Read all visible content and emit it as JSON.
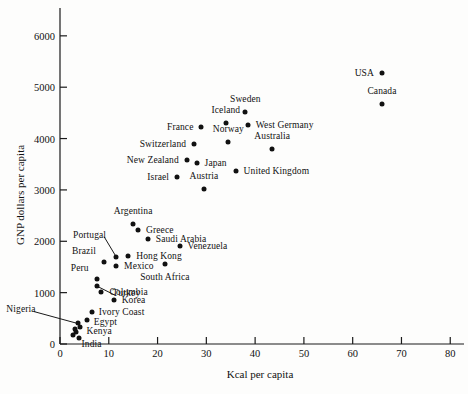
{
  "chart_data": {
    "type": "scatter",
    "title": "",
    "xlabel": "Kcal per capita",
    "ylabel": "GNP dollars per capita",
    "xlim": [
      0,
      82
    ],
    "ylim": [
      0,
      6250
    ],
    "xticks": [
      0,
      10,
      20,
      30,
      40,
      50,
      60,
      70,
      80
    ],
    "yticks": [
      0,
      1000,
      2000,
      3000,
      4000,
      5000,
      6000
    ],
    "grid": false,
    "legend": null,
    "marker_color": "#111111",
    "axis_color": "#1a1a1a",
    "background": "#fdfdfc",
    "points": [
      {
        "label": "USA",
        "x": 66.0,
        "y": 5270,
        "lx": -8,
        "ly": 0,
        "anchor": "r"
      },
      {
        "label": "Canada",
        "x": 66.0,
        "y": 4670,
        "lx": 0,
        "ly": -13,
        "anchor": "c"
      },
      {
        "label": "Sweden",
        "x": 38.0,
        "y": 4520,
        "lx": 0,
        "ly": -13,
        "anchor": "c"
      },
      {
        "label": "Iceland",
        "x": 34.0,
        "y": 4300,
        "lx": 0,
        "ly": -13,
        "anchor": "c"
      },
      {
        "label": "West Germany",
        "x": 38.5,
        "y": 4270,
        "lx": 8,
        "ly": 0,
        "anchor": "l"
      },
      {
        "label": "France",
        "x": 29.0,
        "y": 4230,
        "lx": -8,
        "ly": 0,
        "anchor": "r"
      },
      {
        "label": "Norway",
        "x": 34.5,
        "y": 3940,
        "lx": 0,
        "ly": -13,
        "anchor": "c"
      },
      {
        "label": "Switzerland",
        "x": 27.5,
        "y": 3900,
        "lx": -8,
        "ly": 0,
        "anchor": "r"
      },
      {
        "label": "Australia",
        "x": 43.5,
        "y": 3800,
        "lx": 0,
        "ly": -13,
        "anchor": "c"
      },
      {
        "label": "New Zealand",
        "x": 26.0,
        "y": 3590,
        "lx": -8,
        "ly": 0,
        "anchor": "r"
      },
      {
        "label": "Japan",
        "x": 28.0,
        "y": 3520,
        "lx": 8,
        "ly": 0,
        "anchor": "l"
      },
      {
        "label": "United Kingdom",
        "x": 36.0,
        "y": 3370,
        "lx": 8,
        "ly": 0,
        "anchor": "l"
      },
      {
        "label": "Israel",
        "x": 24.0,
        "y": 3250,
        "lx": -8,
        "ly": 0,
        "anchor": "r"
      },
      {
        "label": "Austria",
        "x": 29.5,
        "y": 3010,
        "lx": 0,
        "ly": -13,
        "anchor": "c"
      },
      {
        "label": "Argentina",
        "x": 15.0,
        "y": 2330,
        "lx": 0,
        "ly": -13,
        "anchor": "c"
      },
      {
        "label": "Greece",
        "x": 16.0,
        "y": 2220,
        "lx": 8,
        "ly": 0,
        "anchor": "l"
      },
      {
        "label": "Saudi Arabia",
        "x": 18.0,
        "y": 2040,
        "lx": 8,
        "ly": 0,
        "anchor": "l"
      },
      {
        "label": "Venezuela",
        "x": 24.5,
        "y": 1900,
        "lx": 8,
        "ly": 0,
        "anchor": "l"
      },
      {
        "label": "Hong Kong",
        "x": 14.0,
        "y": 1710,
        "lx": 8,
        "ly": 0,
        "anchor": "l"
      },
      {
        "label": "Portugal",
        "x": 11.5,
        "y": 1700,
        "lx": -10,
        "ly": -22,
        "anchor": "r",
        "leader": true
      },
      {
        "label": "Brazil",
        "x": 9.0,
        "y": 1600,
        "lx": -8,
        "ly": -11,
        "anchor": "r"
      },
      {
        "label": "South Africa",
        "x": 21.5,
        "y": 1560,
        "lx": 0,
        "ly": 13,
        "anchor": "c"
      },
      {
        "label": "Mexico",
        "x": 11.5,
        "y": 1510,
        "lx": 8,
        "ly": 0,
        "anchor": "l"
      },
      {
        "label": "Peru",
        "x": 7.5,
        "y": 1270,
        "lx": -8,
        "ly": -11,
        "anchor": "r"
      },
      {
        "label": "Turkey",
        "x": 7.5,
        "y": 1130,
        "lx": 16,
        "ly": 7,
        "anchor": "l",
        "leader": true
      },
      {
        "label": "Columbia",
        "x": 8.5,
        "y": 1010,
        "lx": 8,
        "ly": 0,
        "anchor": "l"
      },
      {
        "label": "Korea",
        "x": 11.0,
        "y": 860,
        "lx": 8,
        "ly": 0,
        "anchor": "l"
      },
      {
        "label": "Ivory Coast",
        "x": 6.5,
        "y": 620,
        "lx": 7,
        "ly": 0,
        "anchor": "l"
      },
      {
        "label": "Egypt",
        "x": 5.5,
        "y": 470,
        "lx": 7,
        "ly": 2,
        "anchor": "l"
      },
      {
        "label": "Kenya",
        "x": 4.0,
        "y": 340,
        "lx": 7,
        "ly": 4,
        "anchor": "l"
      },
      {
        "label": "India",
        "x": 3.2,
        "y": 230,
        "lx": 6,
        "ly": 12,
        "anchor": "l"
      },
      {
        "label": "Nigeria",
        "x": 3.6,
        "y": 400,
        "lx": -42,
        "ly": -14,
        "anchor": "r",
        "leader": true
      }
    ],
    "extra_markers": [
      {
        "x": 3.0,
        "y": 300
      },
      {
        "x": 2.6,
        "y": 180
      },
      {
        "x": 3.8,
        "y": 120
      }
    ]
  }
}
